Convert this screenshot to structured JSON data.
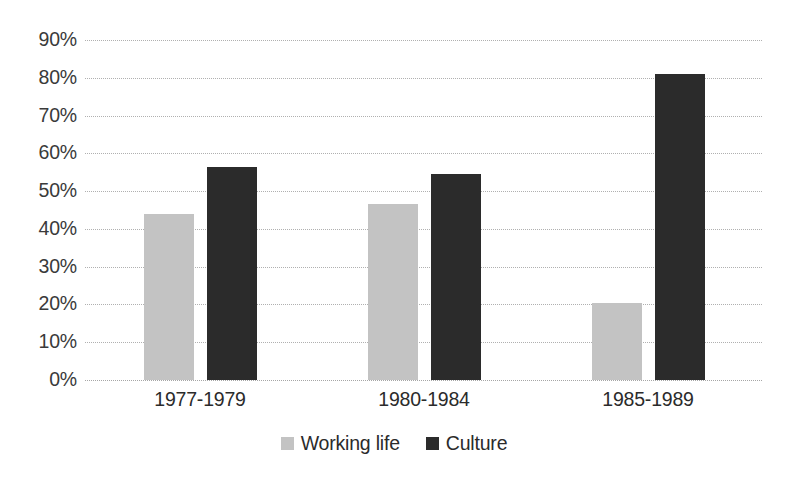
{
  "chart_data": {
    "type": "bar",
    "title": "",
    "subtitle": "",
    "xlabel": "",
    "ylabel": "",
    "categories": [
      "1977-1979",
      "1980-1984",
      "1985-1989"
    ],
    "series": [
      {
        "name": "Working life",
        "color": "#c3c3c3",
        "values": [
          44,
          46.5,
          20.5
        ]
      },
      {
        "name": "Culture",
        "color": "#2b2b2b",
        "values": [
          56.5,
          54.5,
          81
        ]
      }
    ],
    "ylim": [
      0,
      90
    ],
    "ytick_values": [
      0,
      10,
      20,
      30,
      40,
      50,
      60,
      70,
      80,
      90
    ],
    "ytick_labels": [
      "0%",
      "10%",
      "20%",
      "30%",
      "40%",
      "50%",
      "60%",
      "70%",
      "80%",
      "90%"
    ],
    "grid": true,
    "grid_style": "dotted",
    "grid_color": "#b0b0b0",
    "legend_position": "bottom",
    "annotations": []
  },
  "legend": {
    "entries": [
      {
        "label": "Working life",
        "swatch": "legend-swatch-working-life"
      },
      {
        "label": "Culture",
        "swatch": "legend-swatch-culture"
      }
    ]
  }
}
